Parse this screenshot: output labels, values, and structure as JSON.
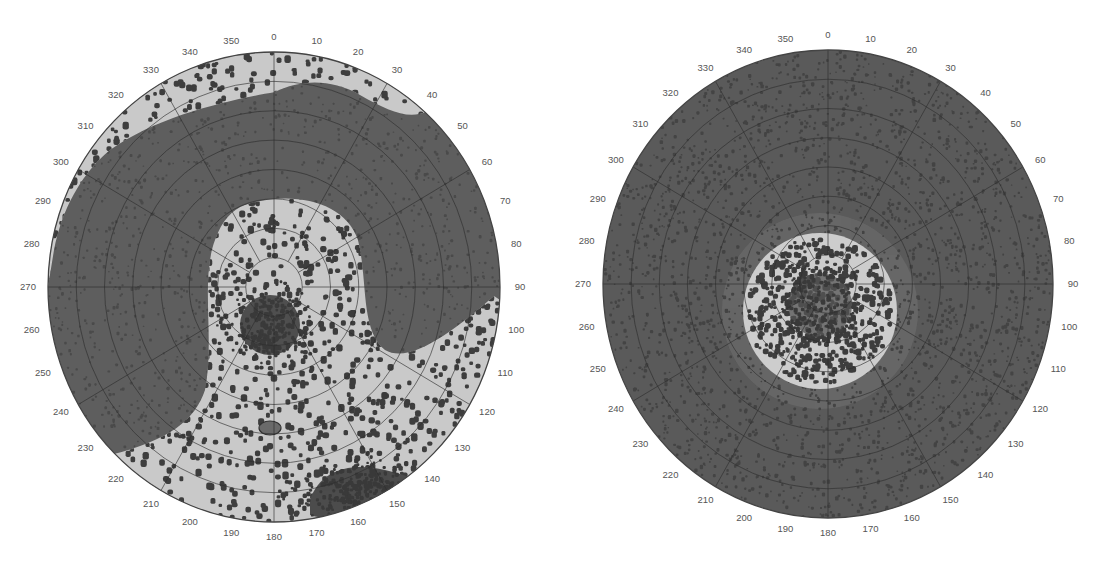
{
  "figure": {
    "width": 1101,
    "height": 561,
    "background": "#ffffff"
  },
  "colors": {
    "light_region": "#c9c9c9",
    "dark_region": "#5e5e5e",
    "mid_ring": "#787878",
    "dot": "#3e3e3e",
    "grid_line": "#2e2e2e",
    "outline": "#444444",
    "label": "#555555"
  },
  "chart_data": [
    {
      "type": "polar",
      "name": "left-polar-plot",
      "title": "",
      "angular_tick_labels": [
        "0",
        "10",
        "20",
        "30",
        "40",
        "50",
        "60",
        "70",
        "80",
        "90",
        "100",
        "110",
        "120",
        "130",
        "140",
        "150",
        "160",
        "170",
        "180",
        "190",
        "200",
        "210",
        "220",
        "230",
        "240",
        "250",
        "260",
        "270",
        "280",
        "290",
        "300",
        "310",
        "320",
        "330",
        "340",
        "350"
      ],
      "angular_direction": "clockwise",
      "zero_at": "top",
      "radial_rings": 8,
      "radial_spokes_deg": 30,
      "center": [
        274,
        287
      ],
      "radius": [
        226,
        235
      ],
      "regions": {
        "outer_light_band": "light, dotted, upper rim from ~300 to ~50 deg",
        "dark_band": "dark horseshoe covering upper and left portions, ~250 to ~100 deg",
        "inner_light_lobe": "light dotted region from center extending to lower half and lower-right edge",
        "central_cluster": "dense dark dot cluster at center",
        "lower_right_cluster": "dense dark dot cluster near 150-165 deg rim",
        "small_feature": "small dark blob below center near 180 deg"
      }
    },
    {
      "type": "polar",
      "name": "right-polar-plot",
      "title": "",
      "angular_tick_labels": [
        "0",
        "10",
        "20",
        "30",
        "40",
        "50",
        "60",
        "70",
        "80",
        "90",
        "100",
        "110",
        "120",
        "130",
        "140",
        "150",
        "160",
        "170",
        "180",
        "190",
        "200",
        "210",
        "220",
        "230",
        "240",
        "250",
        "260",
        "270",
        "280",
        "290",
        "300",
        "310",
        "320",
        "330",
        "340",
        "350"
      ],
      "angular_direction": "clockwise",
      "zero_at": "top",
      "radial_rings": 8,
      "radial_spokes_deg": 30,
      "center": [
        828,
        284
      ],
      "radius": [
        225,
        234
      ],
      "regions": {
        "background": "dark, densely dotted over whole disc",
        "inner_light_ellipse": "light dotted ellipse near center, center approx (820,311), radii ~77x78",
        "central_cluster": "dense dark dots inside light ellipse"
      }
    }
  ],
  "dots": {
    "left_seed": 11,
    "right_seed": 29,
    "left_light_count": 1400,
    "left_center_cluster_count": 260,
    "left_lower_cluster_count": 260,
    "right_inner_count": 520,
    "right_speckle_count": 2600
  }
}
